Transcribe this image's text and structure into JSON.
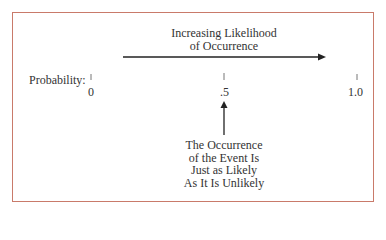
{
  "diagram": {
    "title_line1": "Increasing Likelihood",
    "title_line2": "of Occurrence",
    "axis_label": "Probability:",
    "ticks": [
      {
        "label": "0",
        "value": 0
      },
      {
        "label": ".5",
        "value": 0.5
      },
      {
        "label": "1.0",
        "value": 1.0
      }
    ],
    "note_lines": [
      "The Occurrence",
      "of the Event Is",
      "Just as Likely",
      "As It Is Unlikely"
    ],
    "colors": {
      "border": "#c97a6a",
      "axis_line_start": "#8a7fd0",
      "axis_line_end": "#a8a8a0",
      "arrow": "#222222",
      "text": "#333333"
    }
  }
}
